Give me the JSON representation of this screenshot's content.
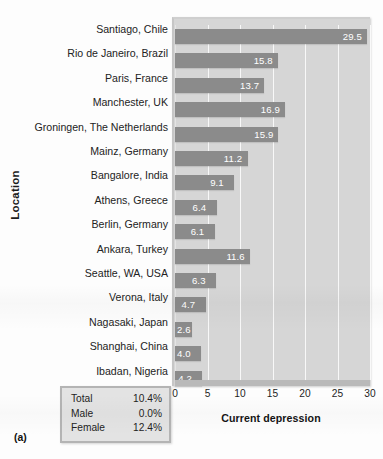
{
  "figure": {
    "panel_label": "(a)",
    "ylabel": "Location",
    "xlabel": "Current depression"
  },
  "stats_box": {
    "rows": [
      {
        "key": "Total",
        "value": "10.4%"
      },
      {
        "key": "Male",
        "value": "0.0%"
      },
      {
        "key": "Female",
        "value": "12.4%"
      }
    ]
  },
  "colors": {
    "bar": "#8b8b8b",
    "plot_background": "#d6d6d6",
    "gridline": "#ffffff",
    "value_label": "#ffffff",
    "statbox_background": "#e3e3e3",
    "statbox_border": "#b4b4b4"
  },
  "chart_data": {
    "type": "bar",
    "orientation": "horizontal",
    "title": "",
    "xlabel": "Current depression",
    "ylabel": "Location",
    "xlim": [
      0,
      30
    ],
    "xticks": [
      0,
      5,
      10,
      15,
      20,
      25,
      30
    ],
    "grid": true,
    "legend": "none",
    "categories": [
      "Santiago, Chile",
      "Rio de Janeiro, Brazil",
      "Paris, France",
      "Manchester, UK",
      "Groningen, The Netherlands",
      "Mainz, Germany",
      "Bangalore, India",
      "Athens, Greece",
      "Berlin, Germany",
      "Ankara, Turkey",
      "Seattle, WA, USA",
      "Verona, Italy",
      "Nagasaki, Japan",
      "Shanghai, China",
      "Ibadan, Nigeria"
    ],
    "values": [
      29.5,
      15.8,
      13.7,
      16.9,
      15.9,
      11.2,
      9.1,
      6.4,
      6.1,
      11.6,
      6.3,
      4.7,
      2.6,
      4.0,
      4.2
    ],
    "value_labels": [
      "29.5",
      "15.8",
      "13.7",
      "16.9",
      "15.9",
      "11.2",
      "9.1",
      "6.4",
      "6.1",
      "11.6",
      "6.3",
      "4.7",
      "2.6",
      "4.0",
      "4.2"
    ],
    "annotations": {
      "Total": "10.4%",
      "Male": "0.0%",
      "Female": "12.4%"
    }
  }
}
